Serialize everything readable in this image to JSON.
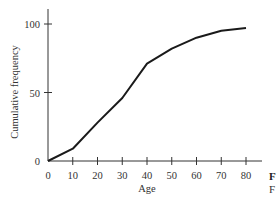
{
  "chart_data": {
    "type": "line",
    "title": "",
    "xlabel": "Age",
    "ylabel": "Cumulative frequency",
    "x": [
      0,
      10,
      20,
      30,
      40,
      50,
      60,
      70,
      80
    ],
    "series": [
      {
        "name": "Cumulative frequency",
        "values": [
          0,
          9,
          28,
          46,
          71,
          82,
          90,
          95,
          97
        ]
      }
    ],
    "xticks": [
      0,
      10,
      20,
      30,
      40,
      50,
      60,
      70,
      80
    ],
    "yticks": [
      0,
      50,
      100
    ],
    "xlim": [
      0,
      88
    ],
    "ylim": [
      0,
      110
    ],
    "grid": false,
    "legend": "none",
    "line_color": "#1a1a1a"
  },
  "labels": {
    "xlabel": "Age",
    "ylabel": "Cumulative frequency",
    "xticks": [
      "0",
      "10",
      "20",
      "30",
      "40",
      "50",
      "60",
      "70",
      "80"
    ],
    "yticks": [
      "0",
      "50",
      "100"
    ]
  },
  "caption": {
    "line1": "F",
    "line2": "F"
  }
}
